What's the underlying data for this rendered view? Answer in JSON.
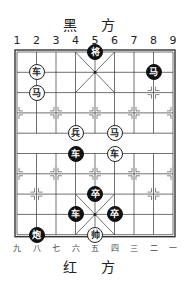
{
  "top_label": "黑 方",
  "bottom_label": "红 方",
  "top_columns": [
    "1",
    "2",
    "3",
    "4",
    "5",
    "6",
    "7",
    "8",
    "9"
  ],
  "bottom_columns": [
    "九",
    "八",
    "七",
    "六",
    "五",
    "四",
    "三",
    "二",
    "一"
  ],
  "board": {
    "left": 17,
    "top": 52,
    "col_spacing": 19.5,
    "row_spacing": 20.3,
    "line_color": "#333333"
  },
  "pieces": [
    {
      "side": "black",
      "char": "将",
      "col": 5,
      "row": 0
    },
    {
      "side": "red",
      "char": "车",
      "col": 2,
      "row": 1
    },
    {
      "side": "black",
      "char": "马",
      "col": 8,
      "row": 1
    },
    {
      "side": "red",
      "char": "马",
      "col": 2,
      "row": 2
    },
    {
      "side": "red",
      "char": "兵",
      "col": 4,
      "row": 4
    },
    {
      "side": "red",
      "char": "马",
      "col": 6,
      "row": 4
    },
    {
      "side": "black",
      "char": "车",
      "col": 4,
      "row": 5
    },
    {
      "side": "red",
      "char": "车",
      "col": 6,
      "row": 5
    },
    {
      "side": "black",
      "char": "卒",
      "col": 5,
      "row": 7
    },
    {
      "side": "black",
      "char": "车",
      "col": 4,
      "row": 8
    },
    {
      "side": "black",
      "char": "卒",
      "col": 6,
      "row": 8
    },
    {
      "side": "black",
      "char": "炮",
      "col": 2,
      "row": 9
    },
    {
      "side": "red",
      "char": "帅",
      "col": 5,
      "row": 9
    }
  ]
}
